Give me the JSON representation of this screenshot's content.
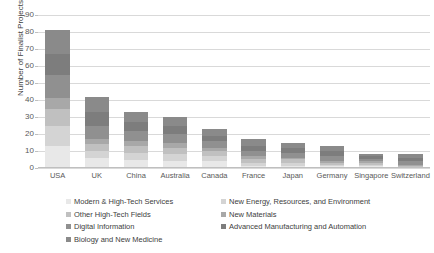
{
  "chart_data": {
    "type": "bar",
    "subtype": "stacked-bar",
    "title": "",
    "xlabel": "",
    "ylabel": "Number of Finalist Projects",
    "ylim": [
      0,
      90
    ],
    "ytick_step": 10,
    "yticks": [
      "90",
      "80",
      "70",
      "60",
      "50",
      "40",
      "30",
      "20",
      "10",
      "0"
    ],
    "grid": true,
    "legend_position": "bottom",
    "legend_columns": 2,
    "categories": [
      "USA",
      "UK",
      "China",
      "Australia",
      "Canada",
      "France",
      "Japan",
      "Germany",
      "Singapore",
      "Switzerland"
    ],
    "series": [
      {
        "name": "Modern & High-Tech Services",
        "color": "#e8e8e8",
        "values": [
          13,
          6,
          5,
          4,
          4,
          1,
          1,
          1,
          1,
          0
        ]
      },
      {
        "name": "New Energy, Resources, and Environment",
        "color": "#d4d4d4",
        "values": [
          12,
          4,
          4,
          4,
          3,
          2,
          2,
          1,
          1,
          0
        ]
      },
      {
        "name": "Other High-Tech Fields",
        "color": "#c0c0c0",
        "values": [
          10,
          4,
          4,
          4,
          3,
          2,
          2,
          1,
          1,
          1
        ]
      },
      {
        "name": "New Materials",
        "color": "#a8a8a8",
        "values": [
          6,
          3,
          3,
          3,
          2,
          2,
          1,
          1,
          1,
          1
        ]
      },
      {
        "name": "Digital Information",
        "color": "#909090",
        "values": [
          14,
          8,
          6,
          5,
          4,
          3,
          3,
          3,
          1,
          2
        ]
      },
      {
        "name": "Advanced Manufacturing and Automation",
        "color": "#7d7d7d",
        "values": [
          12,
          8,
          5,
          5,
          3,
          3,
          3,
          3,
          2,
          2
        ]
      },
      {
        "name": "Biology and New Medicine",
        "color": "#8a8a8a",
        "values": [
          14,
          9,
          6,
          5,
          4,
          4,
          3,
          3,
          1,
          2
        ]
      }
    ],
    "totals": [
      81,
      42,
      33,
      30,
      23,
      17,
      15,
      13,
      8,
      8
    ]
  }
}
